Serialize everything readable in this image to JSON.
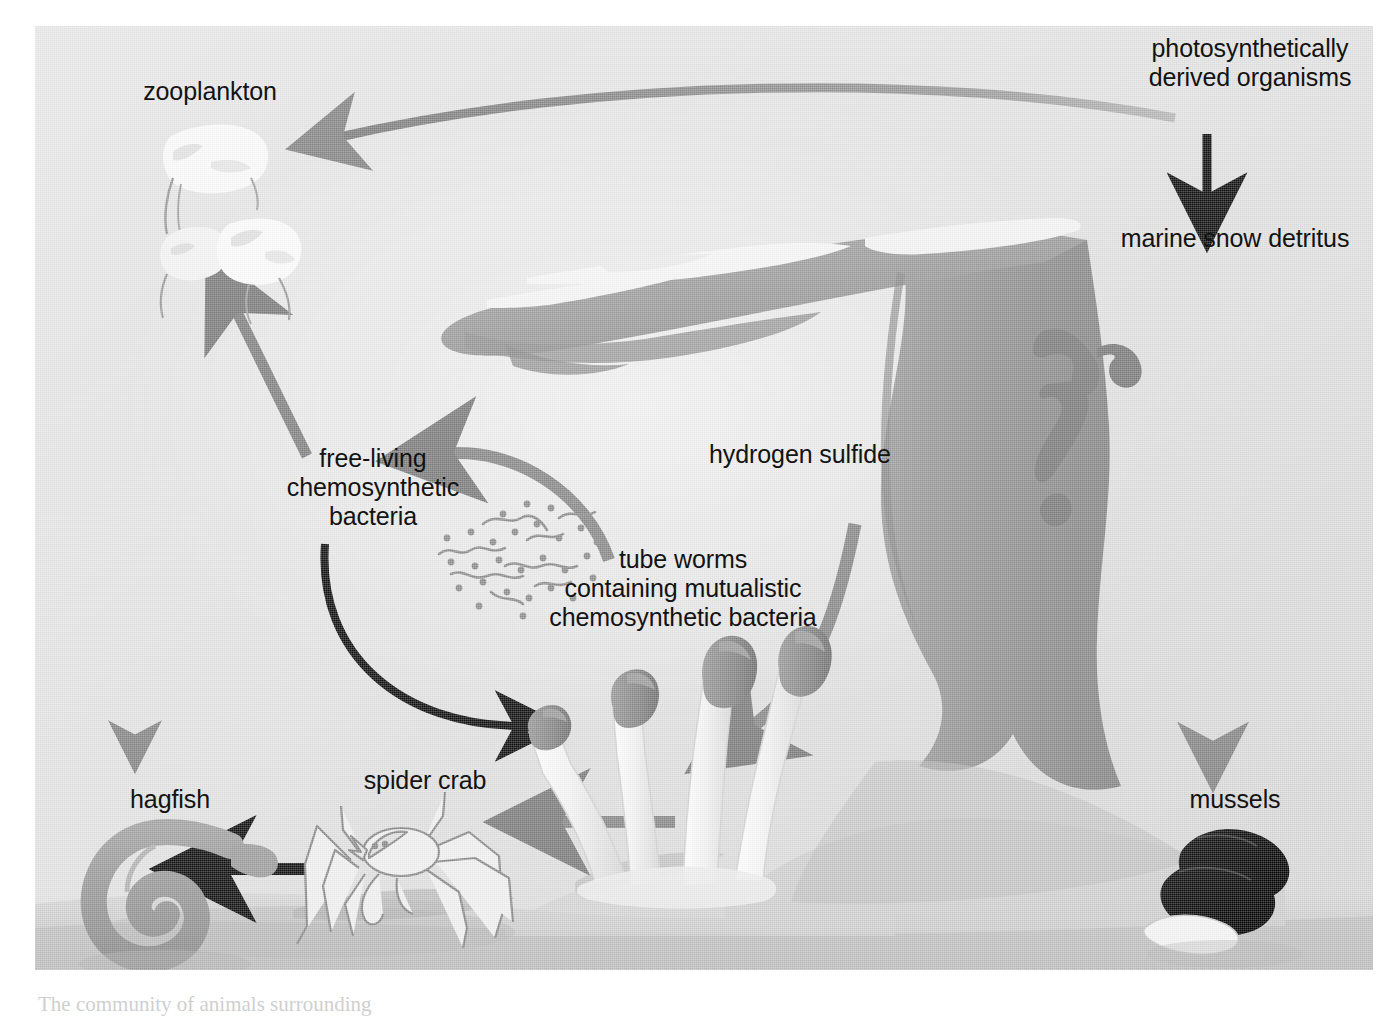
{
  "figure": {
    "caption_fragment": "The community of animals surrounding",
    "background_color": "#e3e3e3",
    "ink_color": "#131313",
    "arrow_gray": "#8d8d8d",
    "arrow_dark_gray": "#7a7a7a",
    "arrow_black": "#111111",
    "vent_plume_color": "#9a9a9a",
    "vent_highlight_color": "#f4f4f4",
    "mussel_color": "#0b0b0b",
    "tubeworm_plume_color": "#8a8a8a",
    "tubeworm_tube_color": "#f2f2f2"
  },
  "labels": {
    "photosynthetically_derived_organisms": "photosynthetically\nderived organisms",
    "marine_snow_detritus": "marine snow detritus",
    "mussels": "mussels",
    "zooplankton": "zooplankton",
    "free_living_chemosynthetic_bacteria": "free-living\nchemosynthetic\nbacteria",
    "tube_worms": "tube worms\ncontaining mutualistic\nchemosynthetic bacteria",
    "hydrogen_sulfide": "hydrogen sulfide",
    "hagfish": "hagfish",
    "spider_crab": "spider crab"
  },
  "organisms": [
    {
      "name": "photosynthetically derived organisms",
      "kind": "source-text",
      "position": "top-right"
    },
    {
      "name": "marine snow detritus",
      "kind": "detritus",
      "position": "right-upper"
    },
    {
      "name": "mussels",
      "kind": "bivalve",
      "position": "bottom-right",
      "count": 3
    },
    {
      "name": "zooplankton",
      "kind": "copepod",
      "position": "top-left",
      "count": 3
    },
    {
      "name": "free-living chemosynthetic bacteria",
      "kind": "bacteria",
      "position": "center-left"
    },
    {
      "name": "tube worms containing mutualistic chemosynthetic bacteria",
      "kind": "tubeworm",
      "position": "center-bottom",
      "count": 4
    },
    {
      "name": "hagfish",
      "kind": "fish",
      "position": "bottom-left"
    },
    {
      "name": "spider crab",
      "kind": "crustacean",
      "position": "bottom-center-left"
    },
    {
      "name": "hydrothermal vent chimney",
      "kind": "vent",
      "position": "center-right"
    }
  ],
  "flows": [
    {
      "from": "photosynthetically derived organisms",
      "to": "marine snow detritus",
      "style": "black-straight-down"
    },
    {
      "from": "marine snow detritus",
      "to": "mussels",
      "style": "gray-long-straight-down"
    },
    {
      "from": "photosynthetically derived organisms",
      "to": "zooplankton",
      "style": "gray-long-curve-left"
    },
    {
      "from": "free-living chemosynthetic bacteria",
      "to": "zooplankton",
      "style": "gray-diagonal-up"
    },
    {
      "from": "zooplankton",
      "to": "hagfish",
      "style": "gray-thin-straight-down"
    },
    {
      "from": "tube worms",
      "to": "free-living chemosynthetic bacteria",
      "style": "gray-arc-left"
    },
    {
      "from": "hydrogen sulfide vent",
      "to": "tube worms",
      "style": "gray-curve-down-left"
    },
    {
      "from": "free-living chemosynthetic bacteria",
      "to": "tube worms",
      "style": "black-arc-down-right"
    },
    {
      "from": "tube worms",
      "to": "spider crab",
      "style": "gray-straight-left"
    },
    {
      "from": "spider crab",
      "to": "hagfish",
      "style": "black-straight-left"
    }
  ]
}
